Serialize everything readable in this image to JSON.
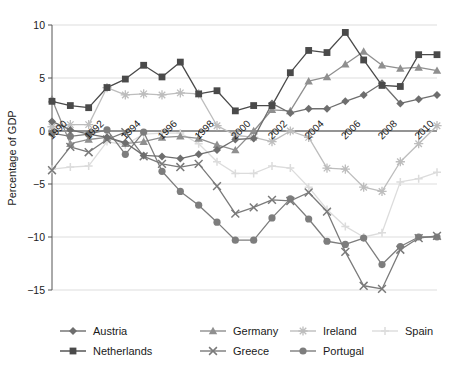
{
  "chart_data": {
    "type": "line",
    "title": "",
    "xlabel": "",
    "ylabel": "Percentage of GDP",
    "xlim": [
      1990,
      2011
    ],
    "ylim": [
      -15,
      10
    ],
    "grid": true,
    "legend_position": "bottom",
    "yticks": [
      10,
      5,
      0,
      -5,
      -10,
      -15
    ],
    "ytick_labels": [
      "10",
      "5",
      "0",
      "−5",
      "−10",
      "−15"
    ],
    "xticks": [
      1990,
      1992,
      1994,
      1996,
      1998,
      2000,
      2002,
      2004,
      2006,
      2008,
      2010
    ],
    "xtick_labels": [
      "1990",
      "1992",
      "1994",
      "1996",
      "1998",
      "2000",
      "2002",
      "2004",
      "2006",
      "2008",
      "2010"
    ],
    "x": [
      1990,
      1991,
      1992,
      1993,
      1994,
      1995,
      1996,
      1997,
      1998,
      1999,
      2000,
      2001,
      2002,
      2003,
      2004,
      2005,
      2006,
      2007,
      2008,
      2009,
      2010,
      2011
    ],
    "series": [
      {
        "name": "Austria",
        "marker": "diamond",
        "color": "#6e6e6e",
        "values": [
          0.9,
          0.1,
          -0.3,
          -0.6,
          -1.1,
          -2.3,
          -2.4,
          -2.6,
          -2.2,
          -1.8,
          -0.8,
          -0.7,
          2.6,
          1.7,
          2.1,
          2.1,
          2.8,
          3.4,
          4.5,
          2.6,
          3.0,
          3.4
        ]
      },
      {
        "name": "Germany",
        "marker": "triangle",
        "color": "#8f8f8f",
        "values": [
          3.0,
          -1.2,
          -0.8,
          -0.6,
          -1.2,
          -1.0,
          -0.6,
          -0.5,
          -0.7,
          -1.3,
          -1.8,
          0.0,
          2.0,
          1.9,
          4.7,
          5.1,
          6.3,
          7.5,
          6.2,
          5.9,
          6.0,
          5.7
        ]
      },
      {
        "name": "Ireland",
        "marker": "asterisk",
        "color": "#bdbdbd",
        "values": [
          0.4,
          0.6,
          0.6,
          4.1,
          3.4,
          3.5,
          3.4,
          3.6,
          3.5,
          0.5,
          -0.4,
          -0.6,
          -1.0,
          0.0,
          -0.6,
          -3.5,
          -3.6,
          -5.3,
          -5.7,
          -2.9,
          -1.2,
          0.5
        ]
      },
      {
        "name": "Spain",
        "marker": "plus",
        "color": "#dcdcdc",
        "values": [
          -3.6,
          -3.4,
          -3.3,
          -1.0,
          -1.3,
          -0.3,
          -0.2,
          -0.2,
          -1.2,
          -2.9,
          -4.0,
          -4.0,
          -3.3,
          -3.5,
          -5.3,
          -7.4,
          -9.0,
          -10.0,
          -9.6,
          -4.8,
          -4.5,
          -3.9
        ]
      },
      {
        "name": "Netherlands",
        "marker": "square",
        "color": "#4a4a4a",
        "values": [
          2.8,
          2.4,
          2.2,
          4.1,
          4.9,
          6.2,
          5.1,
          6.5,
          3.5,
          3.8,
          1.9,
          2.4,
          2.4,
          5.5,
          7.6,
          7.4,
          9.3,
          6.7,
          4.3,
          4.2,
          7.2,
          7.2
        ]
      },
      {
        "name": "Greece",
        "marker": "x",
        "color": "#7a7a7a",
        "values": [
          -3.7,
          -1.5,
          -2.0,
          -0.8,
          -0.1,
          -2.4,
          -3.1,
          -3.4,
          -3.1,
          -5.2,
          -7.8,
          -7.2,
          -6.5,
          -6.6,
          -5.8,
          -7.6,
          -11.4,
          -14.6,
          -14.9,
          -11.2,
          -10.1,
          -9.9
        ]
      },
      {
        "name": "Portugal",
        "marker": "circle",
        "color": "#7d7d7d",
        "values": [
          -0.2,
          -0.5,
          -0.3,
          0.1,
          -2.2,
          -0.1,
          -3.8,
          -5.7,
          -7.0,
          -8.6,
          -10.3,
          -10.3,
          -8.2,
          -6.4,
          -8.3,
          -10.4,
          -10.7,
          -10.1,
          -12.6,
          -10.9,
          -10.0,
          -10.0
        ]
      }
    ]
  },
  "legend": {
    "row1": [
      {
        "label": "Austria",
        "marker": "diamond",
        "color": "#6e6e6e"
      },
      {
        "label": "Germany",
        "marker": "triangle",
        "color": "#8f8f8f"
      },
      {
        "label": "Ireland",
        "marker": "asterisk",
        "color": "#bdbdbd"
      },
      {
        "label": "Spain",
        "marker": "plus",
        "color": "#dcdcdc"
      }
    ],
    "row2": [
      {
        "label": "Netherlands",
        "marker": "square",
        "color": "#4a4a4a"
      },
      {
        "label": "Greece",
        "marker": "x",
        "color": "#7a7a7a"
      },
      {
        "label": "Portugal",
        "marker": "circle",
        "color": "#7d7d7d"
      }
    ]
  }
}
